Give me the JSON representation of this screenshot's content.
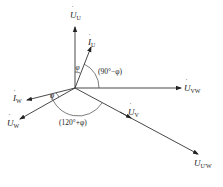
{
  "diagram": {
    "type": "phasor-diagram",
    "origin": [
      75,
      88
    ],
    "phasors": [
      {
        "id": "U_U",
        "symbol": "U",
        "subscript": "U",
        "kind": "voltage",
        "tip": [
          75,
          26
        ]
      },
      {
        "id": "I_U",
        "symbol": "I",
        "subscript": "U",
        "kind": "current",
        "tip": [
          92,
          46
        ]
      },
      {
        "id": "U_VW",
        "symbol": "U",
        "subscript": "VW",
        "kind": "voltage",
        "tip": [
          181,
          88
        ]
      },
      {
        "id": "I_W",
        "symbol": "I",
        "subscript": "W",
        "kind": "current",
        "tip": [
          26,
          100
        ]
      },
      {
        "id": "U_W",
        "symbol": "U",
        "subscript": "W",
        "kind": "voltage",
        "tip": [
          19,
          120
        ]
      },
      {
        "id": "U_V",
        "symbol": "U",
        "subscript": "V",
        "kind": "voltage",
        "tip": [
          131,
          117
        ]
      },
      {
        "id": "U_UW",
        "symbol": "U",
        "subscript": "U'W",
        "kind": "voltage",
        "tip": [
          198,
          154
        ]
      }
    ],
    "angle_labels": {
      "phi_top": "φ",
      "ninety_minus_phi": "(90°−φ)",
      "phi_left": "φ",
      "one_twenty_plus_phi": "(120°+φ)"
    },
    "labels": {
      "U_U": {
        "main": "U",
        "sub": "U"
      },
      "I_U": {
        "main": "I",
        "sub": "U"
      },
      "U_VW": {
        "main": "U",
        "sub": "VW"
      },
      "I_W": {
        "main": "I",
        "sub": "W"
      },
      "U_W": {
        "main": "U",
        "sub": "W"
      },
      "U_V": {
        "main": "U",
        "sub": "V"
      },
      "U_UW": {
        "main": "U",
        "sub": "U'W"
      }
    },
    "colors": {
      "stroke": "#333333",
      "background": "#ffffff"
    }
  }
}
